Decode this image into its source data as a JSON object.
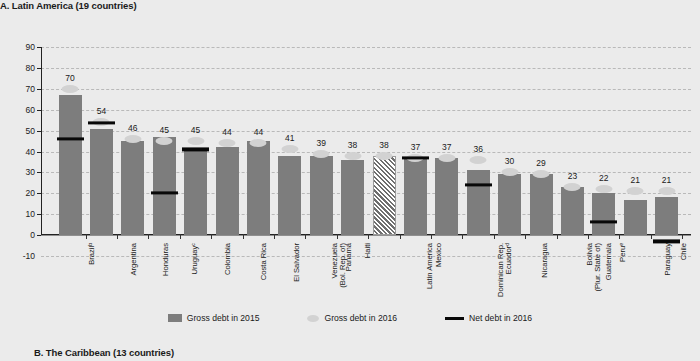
{
  "panel_a_title": "A. Latin America (19 countries)",
  "panel_b_title": "B. The Caribbean (13 countries)",
  "legend": {
    "gross_2015": "Gross debt in 2015",
    "gross_2016": "Gross debt in 2016",
    "net_2016": "Net debt in 2016"
  },
  "chart_data": {
    "type": "bar",
    "title": "A. Latin America (19 countries)",
    "xlabel": "",
    "ylabel": "",
    "ylim": [
      -10,
      90
    ],
    "yticks": [
      -10,
      0,
      10,
      20,
      30,
      40,
      50,
      60,
      70,
      80,
      90
    ],
    "grid": true,
    "legend_position": "bottom-center",
    "categories": [
      "Brazilᵇ",
      "Argentina",
      "Honduras",
      "Uruguayᶜ",
      "Colombia",
      "Costa Rica",
      "El Salvador",
      "Venezuela\n(Bol. Rep. of)",
      "Panama",
      "Haiti",
      "Latin America",
      "Mexico",
      "Dominican Rep.",
      "Ecuadorᵈ",
      "Nicaragua",
      "Bolivia\n(Plur. State of)",
      "Guatemala",
      "Peruᵉ",
      "Paraguay",
      "Chile"
    ],
    "series": [
      {
        "name": "Gross debt in 2015",
        "values": [
          67,
          51,
          45,
          47,
          41,
          42,
          45,
          38,
          38,
          36,
          38,
          37,
          37,
          31,
          29,
          29,
          23,
          20,
          17,
          18
        ]
      },
      {
        "name": "Gross debt in 2016",
        "values": [
          70,
          54,
          46,
          45,
          45,
          44,
          44,
          41,
          39,
          38,
          38,
          37,
          37,
          36,
          30,
          29,
          23,
          22,
          21,
          21
        ]
      },
      {
        "name": "Net debt in 2016",
        "values": [
          46,
          53.5,
          null,
          20,
          41,
          null,
          null,
          null,
          null,
          null,
          null,
          37,
          null,
          24,
          null,
          null,
          null,
          6.5,
          null,
          -3
        ]
      }
    ],
    "value_labels": [
      "70",
      "54",
      "46",
      "45",
      "45",
      "44",
      "44",
      "41",
      "39",
      "38",
      "38",
      "37",
      "37",
      "36",
      "30",
      "29",
      "23",
      "22",
      "21",
      "21"
    ]
  }
}
